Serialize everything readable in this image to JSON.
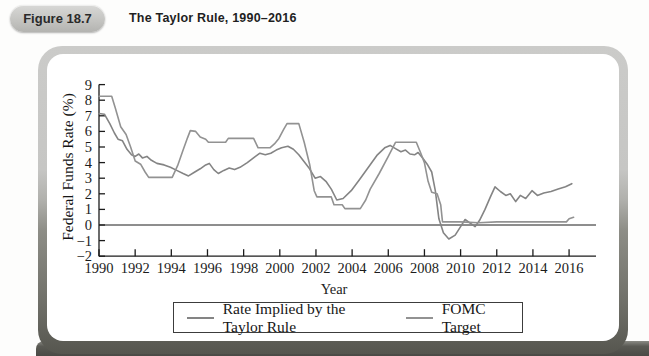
{
  "header": {
    "figure_label": "Figure 18.7",
    "title": "The Taylor Rule, 1990–2016"
  },
  "chart_data": {
    "type": "line",
    "title": "The Taylor Rule, 1990–2016",
    "xlabel": "Year",
    "ylabel": "Federal Funds Rate (%)",
    "xlim": [
      1990,
      2017.5
    ],
    "ylim": [
      -2,
      9
    ],
    "grid": false,
    "zero_line": true,
    "legend_position": "bottom",
    "x_ticks": [
      1990,
      1992,
      1994,
      1996,
      1998,
      2000,
      2002,
      2004,
      2006,
      2008,
      2010,
      2012,
      2014,
      2016
    ],
    "y_ticks": [
      9,
      8,
      7,
      6,
      5,
      4,
      3,
      2,
      1,
      0,
      -1,
      -2
    ],
    "y_tick_labels": [
      "9",
      "8",
      "7",
      "6",
      "5",
      "4",
      "3",
      "2",
      "1",
      "0",
      "−1",
      "−2"
    ],
    "series": [
      {
        "name": "Rate Implied by the Taylor Rule",
        "color": "#848484",
        "points": [
          [
            1990.0,
            7.15
          ],
          [
            1990.3,
            7.1
          ],
          [
            1990.6,
            6.5
          ],
          [
            1990.85,
            5.9
          ],
          [
            1991.05,
            5.5
          ],
          [
            1991.3,
            5.4
          ],
          [
            1991.55,
            4.85
          ],
          [
            1991.8,
            4.5
          ],
          [
            1992.0,
            4.4
          ],
          [
            1992.2,
            4.55
          ],
          [
            1992.4,
            4.3
          ],
          [
            1992.65,
            4.4
          ],
          [
            1992.9,
            4.15
          ],
          [
            1993.2,
            3.95
          ],
          [
            1993.6,
            3.85
          ],
          [
            1993.95,
            3.7
          ],
          [
            1994.3,
            3.5
          ],
          [
            1994.65,
            3.3
          ],
          [
            1994.95,
            3.15
          ],
          [
            1995.3,
            3.4
          ],
          [
            1995.6,
            3.6
          ],
          [
            1995.9,
            3.85
          ],
          [
            1996.1,
            3.95
          ],
          [
            1996.35,
            3.55
          ],
          [
            1996.6,
            3.3
          ],
          [
            1996.9,
            3.5
          ],
          [
            1997.2,
            3.65
          ],
          [
            1997.5,
            3.55
          ],
          [
            1997.8,
            3.7
          ],
          [
            1998.2,
            4.0
          ],
          [
            1998.6,
            4.35
          ],
          [
            1998.9,
            4.6
          ],
          [
            1999.2,
            4.5
          ],
          [
            1999.5,
            4.6
          ],
          [
            1999.8,
            4.8
          ],
          [
            2000.1,
            4.95
          ],
          [
            2000.45,
            5.05
          ],
          [
            2000.75,
            4.85
          ],
          [
            2001.05,
            4.5
          ],
          [
            2001.35,
            4.05
          ],
          [
            2001.65,
            3.6
          ],
          [
            2001.95,
            3.0
          ],
          [
            2002.25,
            3.1
          ],
          [
            2002.55,
            2.8
          ],
          [
            2002.85,
            2.3
          ],
          [
            2003.15,
            1.6
          ],
          [
            2003.5,
            1.7
          ],
          [
            2003.95,
            2.2
          ],
          [
            2004.4,
            2.9
          ],
          [
            2004.9,
            3.7
          ],
          [
            2005.4,
            4.5
          ],
          [
            2005.8,
            4.95
          ],
          [
            2006.1,
            5.1
          ],
          [
            2006.4,
            4.9
          ],
          [
            2006.7,
            4.7
          ],
          [
            2006.95,
            4.8
          ],
          [
            2007.2,
            4.55
          ],
          [
            2007.45,
            4.5
          ],
          [
            2007.65,
            4.65
          ],
          [
            2007.9,
            4.3
          ],
          [
            2008.15,
            3.9
          ],
          [
            2008.4,
            3.4
          ],
          [
            2008.6,
            2.2
          ],
          [
            2008.8,
            0.4
          ],
          [
            2009.05,
            -0.5
          ],
          [
            2009.35,
            -0.9
          ],
          [
            2009.7,
            -0.65
          ],
          [
            2010.0,
            -0.1
          ],
          [
            2010.25,
            0.35
          ],
          [
            2010.55,
            0.1
          ],
          [
            2010.8,
            -0.1
          ],
          [
            2011.05,
            0.3
          ],
          [
            2011.35,
            1.0
          ],
          [
            2011.65,
            1.8
          ],
          [
            2011.9,
            2.45
          ],
          [
            2012.2,
            2.15
          ],
          [
            2012.5,
            1.9
          ],
          [
            2012.75,
            2.0
          ],
          [
            2013.05,
            1.5
          ],
          [
            2013.3,
            1.9
          ],
          [
            2013.6,
            1.7
          ],
          [
            2013.95,
            2.2
          ],
          [
            2014.25,
            1.9
          ],
          [
            2014.6,
            2.05
          ],
          [
            2015.0,
            2.15
          ],
          [
            2015.4,
            2.3
          ],
          [
            2015.8,
            2.45
          ],
          [
            2016.15,
            2.65
          ]
        ]
      },
      {
        "name": "FOMC Target",
        "color": "#929292",
        "points": [
          [
            1990.0,
            8.25
          ],
          [
            1990.7,
            8.25
          ],
          [
            1990.9,
            7.5
          ],
          [
            1991.2,
            6.3
          ],
          [
            1991.5,
            5.8
          ],
          [
            1991.75,
            5.0
          ],
          [
            1992.0,
            4.1
          ],
          [
            1992.3,
            3.9
          ],
          [
            1992.55,
            3.4
          ],
          [
            1992.75,
            3.05
          ],
          [
            1993.0,
            3.05
          ],
          [
            1994.05,
            3.05
          ],
          [
            1994.35,
            3.8
          ],
          [
            1994.65,
            4.8
          ],
          [
            1994.9,
            5.6
          ],
          [
            1995.05,
            6.05
          ],
          [
            1995.35,
            6.0
          ],
          [
            1995.6,
            5.65
          ],
          [
            1995.9,
            5.5
          ],
          [
            1996.05,
            5.3
          ],
          [
            1997.0,
            5.3
          ],
          [
            1997.15,
            5.55
          ],
          [
            1998.55,
            5.55
          ],
          [
            1998.8,
            4.95
          ],
          [
            1999.45,
            4.95
          ],
          [
            1999.7,
            5.2
          ],
          [
            1999.95,
            5.55
          ],
          [
            2000.2,
            6.1
          ],
          [
            2000.4,
            6.5
          ],
          [
            2001.05,
            6.5
          ],
          [
            2001.35,
            5.3
          ],
          [
            2001.65,
            3.9
          ],
          [
            2001.9,
            2.2
          ],
          [
            2002.05,
            1.8
          ],
          [
            2002.85,
            1.8
          ],
          [
            2003.0,
            1.3
          ],
          [
            2003.45,
            1.3
          ],
          [
            2003.6,
            1.05
          ],
          [
            2004.45,
            1.05
          ],
          [
            2004.75,
            1.6
          ],
          [
            2005.0,
            2.3
          ],
          [
            2005.5,
            3.3
          ],
          [
            2006.0,
            4.4
          ],
          [
            2006.4,
            5.3
          ],
          [
            2007.55,
            5.3
          ],
          [
            2007.8,
            4.6
          ],
          [
            2008.0,
            4.0
          ],
          [
            2008.2,
            2.8
          ],
          [
            2008.4,
            2.1
          ],
          [
            2008.7,
            2.0
          ],
          [
            2008.9,
            1.3
          ],
          [
            2009.0,
            0.2
          ],
          [
            2010.0,
            0.2
          ],
          [
            2011.0,
            0.15
          ],
          [
            2012.0,
            0.2
          ],
          [
            2013.0,
            0.2
          ],
          [
            2014.0,
            0.2
          ],
          [
            2015.0,
            0.2
          ],
          [
            2015.85,
            0.2
          ],
          [
            2016.0,
            0.4
          ],
          [
            2016.25,
            0.5
          ]
        ]
      }
    ]
  },
  "colors": {
    "frame_light": "#cbcbc9",
    "frame_dark": "#56564f",
    "axis": "#1c1c1c",
    "badge_bg": "#c9c9c6"
  }
}
